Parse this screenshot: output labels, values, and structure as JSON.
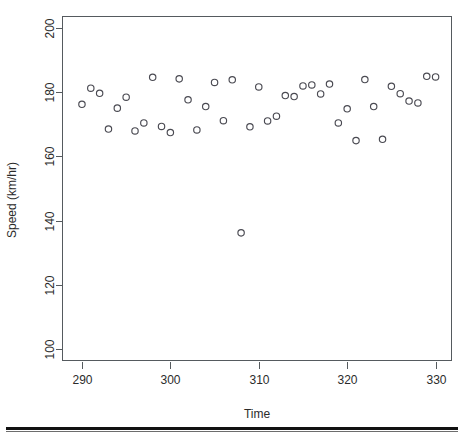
{
  "figure": {
    "name": "speed-vs-time-scatter",
    "background_color": "#ffffff",
    "point_color": "#4a4a52",
    "axis_color": "#555a5e",
    "text_color": "#2b2b2b"
  },
  "footer": {
    "rule_color": "#111111"
  },
  "chart_data": {
    "type": "scatter",
    "title": "",
    "xlabel": "Time",
    "ylabel": "Speed (km/hr)",
    "xlim": [
      287.8,
      331.8
    ],
    "ylim": [
      96.5,
      203.5
    ],
    "xticks": [
      290,
      300,
      310,
      320,
      330
    ],
    "xticklabels": [
      "290",
      "300",
      "310",
      "320",
      "330"
    ],
    "yticks": [
      100,
      120,
      140,
      160,
      180,
      200
    ],
    "yticklabels": [
      "100",
      "120",
      "140",
      "160",
      "180",
      "200"
    ],
    "grid": false,
    "legend": null,
    "marker": "open-circle",
    "marker_radius_px": 3.2,
    "series": [
      {
        "name": "speed",
        "x": [
          290,
          291,
          292,
          293,
          294,
          295,
          296,
          297,
          298,
          299,
          300,
          301,
          302,
          303,
          304,
          305,
          306,
          307,
          308,
          309,
          310,
          311,
          312,
          313,
          314,
          315,
          316,
          317,
          318,
          319,
          320,
          321,
          322,
          323,
          324,
          325,
          326,
          327,
          328,
          329,
          330
        ],
        "y": [
          176.2,
          181.2,
          179.6,
          168.5,
          175.0,
          178.4,
          167.9,
          170.4,
          184.6,
          169.3,
          167.4,
          184.1,
          177.6,
          168.2,
          175.5,
          183.0,
          171.1,
          183.8,
          136.2,
          169.2,
          181.6,
          171.0,
          172.5,
          178.9,
          178.6,
          181.9,
          182.2,
          179.4,
          182.5,
          170.4,
          174.8,
          164.9,
          183.9,
          175.5,
          165.3,
          181.8,
          179.5,
          177.2,
          176.6,
          184.9,
          184.7
        ]
      }
    ]
  }
}
